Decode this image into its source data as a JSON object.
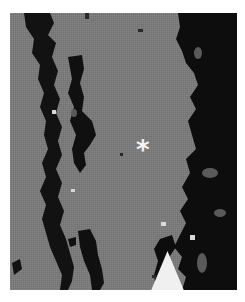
{
  "image": {
    "type": "grayscale micrograph",
    "background_color": "#7c7c7c",
    "dark_region_color": "#0e0e0e",
    "border_color": "#ffffff"
  },
  "annotations": {
    "asterisk": {
      "label": "*",
      "color": "#f4f4f4",
      "x": 145,
      "y": 146
    },
    "arrow": {
      "direction": "up",
      "color": "#f0f0f0",
      "x": 59,
      "y": 258
    }
  }
}
